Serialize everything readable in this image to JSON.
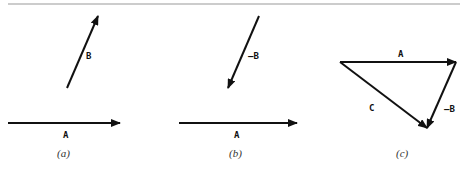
{
  "figure": {
    "panels": [
      {
        "caption": "(a)",
        "vectors": [
          {
            "label": "A",
            "from": [
              8,
              123
            ],
            "to": [
              120,
              123
            ]
          },
          {
            "label": "B",
            "from": [
              67,
              88
            ],
            "to": [
              98,
              16
            ]
          }
        ]
      },
      {
        "caption": "(b)",
        "vectors": [
          {
            "label": "A",
            "from": [
              179,
              123
            ],
            "to": [
              297,
              123
            ]
          },
          {
            "label": "—B",
            "from": [
              259,
              16
            ],
            "to": [
              228,
              88
            ]
          }
        ]
      },
      {
        "caption": "(c)",
        "vectors": [
          {
            "label": "A",
            "from": [
              340,
              62
            ],
            "to": [
              456,
              62
            ]
          },
          {
            "label": "—B",
            "from": [
              456,
              62
            ],
            "to": [
              427,
              128
            ]
          },
          {
            "label": "C",
            "from": [
              340,
              62
            ],
            "to": [
              427,
              128
            ]
          }
        ]
      }
    ],
    "colors": {
      "stroke": "#111111",
      "rule": "#999999",
      "caption": "#333333"
    }
  }
}
